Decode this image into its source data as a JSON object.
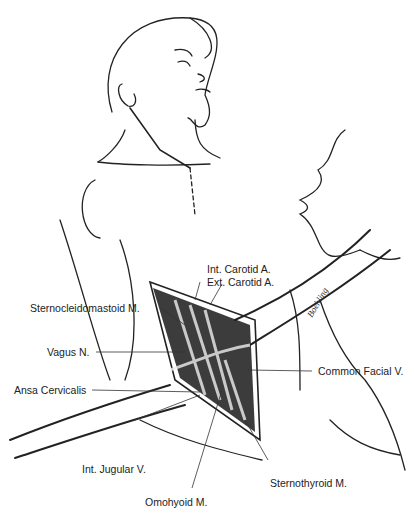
{
  "figure": {
    "signature": "Boehling",
    "labels": {
      "int_carotid": "Int. Carotid A.",
      "ext_carotid": "Ext. Carotid A.",
      "scm": "Sternocleidomastoid M.",
      "vagus": "Vagus N.",
      "ansa": "Ansa Cervicalis",
      "common_facial": "Common Facial V.",
      "int_jugular": "Int. Jugular V.",
      "sternothyroid": "Sternothyroid M.",
      "omohyoid": "Omohyoid M."
    }
  }
}
